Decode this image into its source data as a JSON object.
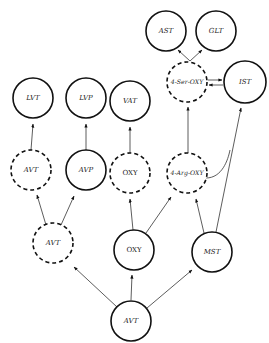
{
  "diagram": {
    "type": "pathway-graph",
    "nodes": [
      {
        "id": "ast",
        "label": "AST",
        "x": 166,
        "y": 31,
        "r": 20,
        "style": "solid",
        "italic": true
      },
      {
        "id": "glt",
        "label": "GLT",
        "x": 216,
        "y": 31,
        "r": 20,
        "style": "solid",
        "italic": true
      },
      {
        "id": "ser_oxy",
        "label": "4-Ser-OXY",
        "x": 187,
        "y": 82,
        "r": 20,
        "style": "dashed",
        "italic": true
      },
      {
        "id": "ist",
        "label": "IST",
        "x": 245,
        "y": 82,
        "r": 21,
        "style": "solid",
        "italic": true
      },
      {
        "id": "lvt",
        "label": "LVT",
        "x": 33,
        "y": 98,
        "r": 20,
        "style": "solid",
        "italic": true
      },
      {
        "id": "lvp",
        "label": "LVP",
        "x": 86,
        "y": 98,
        "r": 20,
        "style": "solid",
        "italic": true
      },
      {
        "id": "vat",
        "label": "VAT",
        "x": 130,
        "y": 101,
        "r": 20,
        "style": "solid",
        "italic": true
      },
      {
        "id": "avt_mid",
        "label": "AVT",
        "x": 31,
        "y": 170,
        "r": 20,
        "style": "dashed",
        "italic": true
      },
      {
        "id": "avp",
        "label": "AVP",
        "x": 86,
        "y": 170,
        "r": 20,
        "style": "solid",
        "italic": true
      },
      {
        "id": "oxy_mid",
        "label": "OXY",
        "x": 130,
        "y": 173,
        "r": 20,
        "style": "dashed",
        "italic": false
      },
      {
        "id": "arg_oxy",
        "label": "4-Arg-OXY",
        "x": 187,
        "y": 173,
        "r": 20,
        "style": "dashed",
        "italic": true
      },
      {
        "id": "avt_low",
        "label": "AVT",
        "x": 53,
        "y": 243,
        "r": 20,
        "style": "dashed",
        "italic": true
      },
      {
        "id": "oxy_low",
        "label": "OXY",
        "x": 134,
        "y": 250,
        "r": 20,
        "style": "solid",
        "italic": false
      },
      {
        "id": "mst",
        "label": "MST",
        "x": 212,
        "y": 252,
        "r": 20,
        "style": "solid",
        "italic": true
      },
      {
        "id": "avt_root",
        "label": "AVT",
        "x": 131,
        "y": 321,
        "r": 20,
        "style": "solid",
        "italic": true
      }
    ],
    "edges": [
      {
        "from": "avt_root",
        "to": "avt_low"
      },
      {
        "from": "avt_root",
        "to": "oxy_low"
      },
      {
        "from": "avt_root",
        "to": "mst"
      },
      {
        "from": "avt_low",
        "to": "avt_mid"
      },
      {
        "from": "avt_low",
        "to": "avp"
      },
      {
        "from": "oxy_low",
        "to": "oxy_mid"
      },
      {
        "from": "oxy_low",
        "to": "arg_oxy"
      },
      {
        "from": "mst",
        "to": "arg_oxy"
      },
      {
        "from": "mst",
        "to": "ist"
      },
      {
        "from": "avt_mid",
        "to": "lvt"
      },
      {
        "from": "avp",
        "to": "lvp"
      },
      {
        "from": "oxy_mid",
        "to": "vat"
      },
      {
        "from": "arg_oxy",
        "to": "ser_oxy"
      },
      {
        "from": "arg_oxy",
        "to": "ist",
        "curved": true
      },
      {
        "from": "ser_oxy",
        "to": "ast"
      },
      {
        "from": "ser_oxy",
        "to": "glt"
      },
      {
        "from": "ser_oxy",
        "to": "ist"
      },
      {
        "from": "ist",
        "to": "ser_oxy"
      }
    ]
  }
}
